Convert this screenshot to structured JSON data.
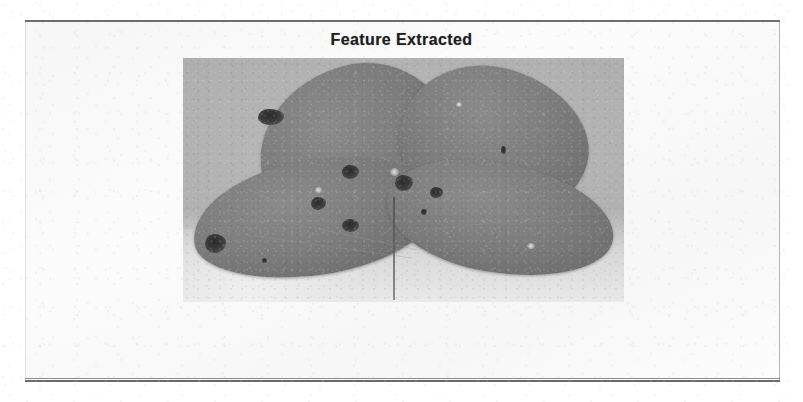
{
  "page": {
    "background_color": "#ffffff",
    "panel_tint": "#f5f5f5",
    "rule_color": "#6e6e6e"
  },
  "figure": {
    "title": "Feature Extracted",
    "title_color": "#1e1e1e",
    "image": {
      "alt_name": "leaf-photograph",
      "description": "Grayscale photograph of a four-leaflet plant leaf with dark lesion spots",
      "background_color": "#b9b9b9",
      "leaf_color": "#7d7d7d",
      "lesion_color": "#2b2b2b",
      "leaflets": [
        {
          "name": "top-left-leaflet"
        },
        {
          "name": "top-right-leaflet"
        },
        {
          "name": "bottom-left-leaflet"
        },
        {
          "name": "bottom-right-leaflet"
        }
      ],
      "lesions": [
        {
          "name": "lesion-1",
          "leaflet": "top-left-leaflet"
        },
        {
          "name": "lesion-2",
          "leaflet": "top-left-leaflet"
        },
        {
          "name": "lesion-3",
          "leaflet": "bottom-left-leaflet"
        },
        {
          "name": "lesion-4",
          "leaflet": "bottom-left-leaflet"
        },
        {
          "name": "lesion-5",
          "leaflet": "bottom-left-leaflet"
        },
        {
          "name": "lesion-6",
          "leaflet": "bottom-left-leaflet"
        },
        {
          "name": "lesion-7",
          "leaflet": "bottom-right-leaflet"
        },
        {
          "name": "lesion-8",
          "leaflet": "bottom-right-leaflet"
        },
        {
          "name": "lesion-9",
          "leaflet": "bottom-right-leaflet"
        },
        {
          "name": "lesion-10",
          "leaflet": "top-right-leaflet"
        }
      ]
    }
  },
  "ghost_text": {
    "line_1": "",
    "line_2": "",
    "line_3": "",
    "line_4": ""
  }
}
